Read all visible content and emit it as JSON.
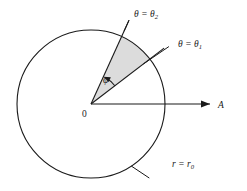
{
  "figure": {
    "type": "geometry-diagram",
    "background_color": "#ffffff",
    "stroke_color": "#1a1a1a",
    "sector_fill_color": "#dcdcdc",
    "circle": {
      "center_x": 91,
      "center_y": 104,
      "radius": 74,
      "label": "r = r₀",
      "label_parts": {
        "var": "r",
        "eq": "=",
        "value": "r",
        "subscript": "0"
      },
      "label_x": 171,
      "label_y": 166
    },
    "axis": {
      "label": "A",
      "label_x": 232,
      "label_y": 107,
      "start_x": 91,
      "start_y": 104,
      "end_x": 214,
      "end_y": 104,
      "arrowhead": "right"
    },
    "origin": {
      "label": "0",
      "label_x": 84,
      "label_y": 116
    },
    "rays": [
      {
        "name": "theta-2",
        "label": "θ = θ₂",
        "label_parts": {
          "var": "θ",
          "eq": "=",
          "value": "θ",
          "subscript": "2"
        },
        "angle_deg": 65.6,
        "length": 92,
        "label_x": 136,
        "label_y": 16
      },
      {
        "name": "theta-1",
        "label": "θ = θ₁",
        "label_parts": {
          "var": "θ",
          "eq": "=",
          "value": "θ",
          "subscript": "1"
        },
        "angle_deg": 37.4,
        "length": 92,
        "label_x": 178,
        "label_y": 46
      }
    ],
    "angle_marker": {
      "name": "phi",
      "label": "φ",
      "label_x": 106,
      "label_y": 80,
      "arc_radius": 30,
      "from_deg": 37.4,
      "to_deg": 65.6,
      "arrowhead": "to-theta-2"
    }
  }
}
